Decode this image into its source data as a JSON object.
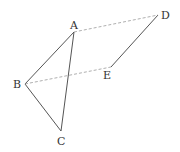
{
  "diagram": {
    "points": {
      "A": {
        "label": "A",
        "x": 74,
        "y": 32,
        "lx": 70,
        "ly": 29
      },
      "B": {
        "label": "B",
        "x": 25,
        "y": 84,
        "lx": 13,
        "ly": 88
      },
      "C": {
        "label": "C",
        "x": 61,
        "y": 131,
        "lx": 57,
        "ly": 145
      },
      "D": {
        "label": "D",
        "x": 158,
        "y": 15,
        "lx": 161,
        "ly": 19
      },
      "E": {
        "label": "E",
        "x": 111,
        "y": 67,
        "lx": 103,
        "ly": 79
      }
    },
    "solid_segments": [
      [
        "A",
        "B"
      ],
      [
        "B",
        "C"
      ],
      [
        "A",
        "C"
      ],
      [
        "D",
        "E"
      ]
    ],
    "dashed_segments": [
      [
        "A",
        "D"
      ],
      [
        "B",
        "E"
      ]
    ],
    "colors": {
      "solid": "#555555",
      "dashed": "#9a9a9a",
      "text": "#333333"
    }
  }
}
